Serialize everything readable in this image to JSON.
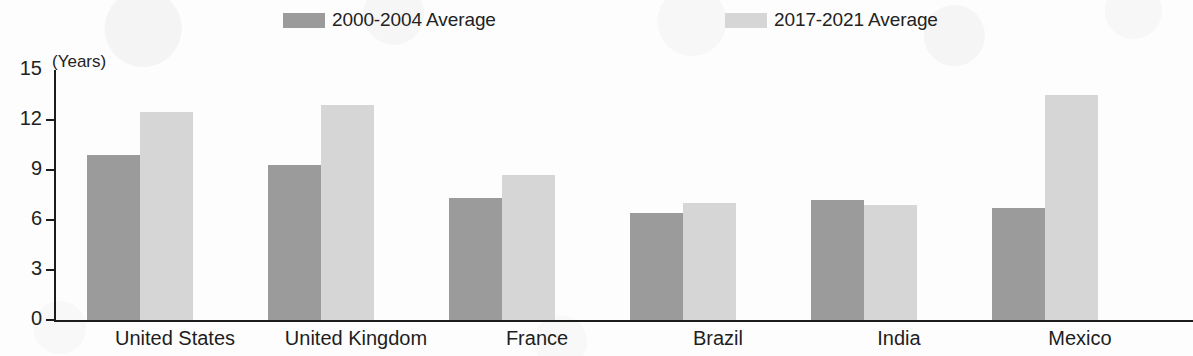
{
  "chart_data": {
    "type": "bar",
    "title": "",
    "subtitle": "",
    "xlabel": "",
    "ylabel": "(Years)",
    "unit_label": "(Years)",
    "ylim": [
      0,
      15
    ],
    "yticks": [
      0,
      3,
      6,
      9,
      12,
      15
    ],
    "ytick_labels": [
      "0",
      "3",
      "6",
      "9",
      "12",
      "15"
    ],
    "grid": false,
    "legend_position": "top",
    "categories": [
      "United States",
      "United Kingdom",
      "France",
      "Brazil",
      "India",
      "Mexico"
    ],
    "series": [
      {
        "name": "2000-2004 Average",
        "color": "#9b9b9b",
        "values": [
          9.9,
          9.3,
          7.3,
          6.4,
          7.2,
          6.7
        ]
      },
      {
        "name": "2017-2021 Average",
        "color": "#d6d6d6",
        "values": [
          12.5,
          12.9,
          8.7,
          7.0,
          6.9,
          13.5
        ]
      }
    ]
  },
  "legend": {
    "items": [
      {
        "label": "2000-2004 Average",
        "color": "#9b9b9b"
      },
      {
        "label": "2017-2021 Average",
        "color": "#d6d6d6"
      }
    ]
  },
  "axes": {
    "unit_label": "(Years)",
    "y_tick_labels": [
      "15",
      "12",
      "9",
      "6",
      "3",
      "0"
    ],
    "x_tick_labels": [
      "United States",
      "United Kingdom",
      "France",
      "Brazil",
      "India",
      "Mexico"
    ]
  },
  "colors": {
    "series_1": "#9b9b9b",
    "series_2": "#d6d6d6",
    "axis": "#1c1c1c",
    "text": "#222222",
    "background": "#fdfdfd"
  }
}
